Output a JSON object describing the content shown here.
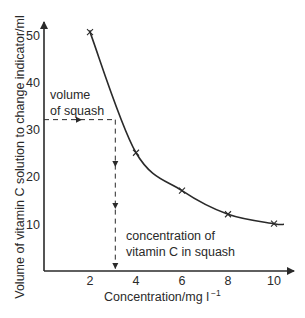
{
  "chart_data": {
    "type": "line",
    "title": "",
    "xlabel": "Concentration/mg l",
    "xlabel_superscript": "−1",
    "ylabel": "Volume of vitamin C solution to change indicator/ml",
    "xlim": [
      0,
      10.5
    ],
    "ylim": [
      0,
      53
    ],
    "x_ticks": [
      2,
      4,
      6,
      8,
      10
    ],
    "y_ticks": [
      10,
      20,
      30,
      40,
      50
    ],
    "grid": false,
    "legend": null,
    "series": [
      {
        "name": "calibration curve",
        "marker": "x",
        "x": [
          2,
          4,
          6,
          8,
          10
        ],
        "y": [
          50.5,
          25,
          17,
          12,
          10
        ]
      }
    ],
    "annotations": [
      {
        "lines": [
          "volume",
          "of squash"
        ],
        "x": 0.3,
        "y": 36.5
      },
      {
        "lines": [
          "concentration of",
          "vitamin C in squash"
        ],
        "x": 3.6,
        "y": 7
      }
    ],
    "reading": {
      "volume_of_squash": 32,
      "concentration_of_vitamin_c": 3.1
    }
  },
  "colors": {
    "ink": "#2a2a2a",
    "background": "#ffffff"
  }
}
